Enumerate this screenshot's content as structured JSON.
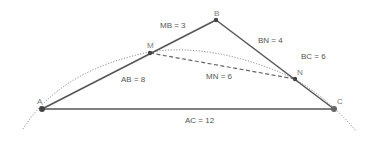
{
  "diagram": {
    "type": "geometry-triangle",
    "points": {
      "A": {
        "label": "A",
        "x": 42,
        "y": 109
      },
      "B": {
        "label": "B",
        "x": 216,
        "y": 20
      },
      "C": {
        "label": "C",
        "x": 334,
        "y": 109
      },
      "M": {
        "label": "M",
        "x": 150,
        "y": 53
      },
      "N": {
        "label": "N",
        "x": 295,
        "y": 79
      }
    },
    "segments": [
      {
        "from": "A",
        "to": "B",
        "style": "solid"
      },
      {
        "from": "B",
        "to": "C",
        "style": "solid"
      },
      {
        "from": "A",
        "to": "C",
        "style": "solid"
      },
      {
        "from": "M",
        "to": "N",
        "style": "dashed"
      }
    ],
    "curve": {
      "style": "dotted",
      "description": "arc through A, M, N, C"
    },
    "measurements": {
      "mb": "MB = 3",
      "ab": "AB = 8",
      "bn": "BN = 4",
      "bc": "BC = 6",
      "mn": "MN = 6",
      "ac": "AC = 12"
    },
    "colors": {
      "line": "#555555",
      "point": "#444444",
      "curve": "#888888",
      "text": "#555555"
    }
  }
}
